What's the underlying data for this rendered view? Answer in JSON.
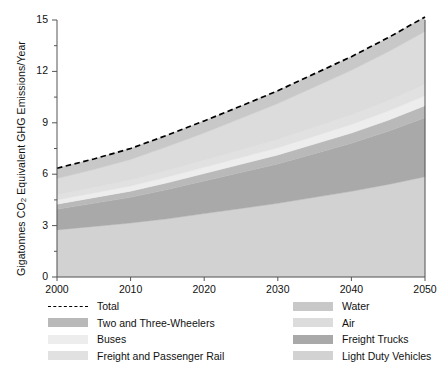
{
  "chart_data": {
    "type": "area",
    "stacked": true,
    "title": "",
    "xlabel": "",
    "ylabel": "Gigatonnes CO2 Equivalent GHG Emissions/Year",
    "ylabel_rich": {
      "pre": "Gigatonnes CO",
      "sub": "2",
      "post": " Equivalent GHG Emissions/Year"
    },
    "xlim": [
      2000,
      2050
    ],
    "ylim": [
      0,
      15
    ],
    "xticks": [
      2000,
      2010,
      2020,
      2030,
      2040,
      2050
    ],
    "yticks": [
      0,
      3,
      6,
      9,
      12,
      15
    ],
    "yticks_minor": [
      1.5,
      4.5,
      7.5,
      10.5,
      13.5
    ],
    "grid": false,
    "legend_position": "below",
    "x": [
      2000,
      2005,
      2010,
      2015,
      2020,
      2025,
      2030,
      2035,
      2040,
      2045,
      2050
    ],
    "series": [
      {
        "name": "Light Duty Vehicles",
        "color": "#d2d2d2",
        "values": [
          2.75,
          2.95,
          3.15,
          3.4,
          3.7,
          4.0,
          4.3,
          4.65,
          5.0,
          5.4,
          5.85
        ]
      },
      {
        "name": "Freight Trucks",
        "color": "#a9a9a9",
        "values": [
          1.2,
          1.35,
          1.5,
          1.7,
          1.9,
          2.1,
          2.3,
          2.55,
          2.8,
          3.1,
          3.45
        ]
      },
      {
        "name": "Two and Three-Wheelers",
        "color": "#b9b9b9",
        "values": [
          0.3,
          0.33,
          0.36,
          0.4,
          0.44,
          0.48,
          0.52,
          0.56,
          0.6,
          0.65,
          0.7
        ]
      },
      {
        "name": "Buses",
        "color": "#ededed",
        "values": [
          0.25,
          0.27,
          0.3,
          0.33,
          0.36,
          0.39,
          0.42,
          0.46,
          0.5,
          0.54,
          0.58
        ]
      },
      {
        "name": "Freight and Passenger Rail",
        "color": "#e1e1e1",
        "values": [
          0.3,
          0.32,
          0.35,
          0.38,
          0.41,
          0.44,
          0.48,
          0.52,
          0.56,
          0.6,
          0.65
        ]
      },
      {
        "name": "Air",
        "color": "#dcdcdc",
        "values": [
          0.95,
          1.05,
          1.2,
          1.4,
          1.6,
          1.85,
          2.1,
          2.35,
          2.6,
          2.85,
          3.1
        ]
      },
      {
        "name": "Water",
        "color": "#c8c8c8",
        "values": [
          0.6,
          0.62,
          0.64,
          0.67,
          0.7,
          0.72,
          0.75,
          0.78,
          0.8,
          0.83,
          0.85
        ]
      }
    ],
    "total": {
      "name": "Total",
      "style": "dashed",
      "color": "#000000",
      "values": [
        6.35,
        6.89,
        7.5,
        8.28,
        9.11,
        9.98,
        10.87,
        11.87,
        12.86,
        13.97,
        15.18
      ]
    },
    "annotations": []
  },
  "legend": {
    "left_column": [
      {
        "label": "Total",
        "type": "dashed-line",
        "color": "#000000"
      },
      {
        "label": "Two and Three-Wheelers",
        "type": "swatch",
        "color": "#b9b9b9"
      },
      {
        "label": "Buses",
        "type": "swatch",
        "color": "#ededed"
      },
      {
        "label": "Freight and Passenger Rail",
        "type": "swatch",
        "color": "#e1e1e1"
      }
    ],
    "right_column": [
      {
        "label": "Water",
        "type": "swatch",
        "color": "#c8c8c8"
      },
      {
        "label": "Air",
        "type": "swatch",
        "color": "#dcdcdc"
      },
      {
        "label": "Freight Trucks",
        "type": "swatch",
        "color": "#a9a9a9"
      },
      {
        "label": "Light Duty Vehicles",
        "type": "swatch",
        "color": "#d2d2d2"
      }
    ]
  },
  "axes": {
    "y_tick_labels": [
      "15",
      "12",
      "9",
      "6",
      "3",
      "0"
    ],
    "x_tick_labels": [
      "2000",
      "2010",
      "2020",
      "2030",
      "2040",
      "2050"
    ]
  }
}
